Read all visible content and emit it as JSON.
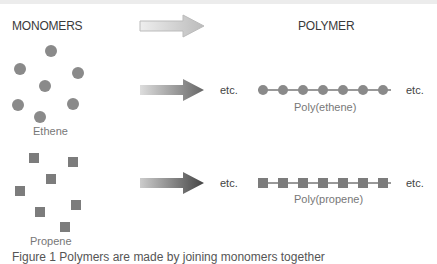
{
  "headers": {
    "monomers": "MONOMERS",
    "polymer": "POLYMER"
  },
  "rows": [
    {
      "monomer": "Ethene",
      "polymer": "Poly(ethene)",
      "unit_shape": "circle",
      "arrow_color": "#777777"
    },
    {
      "monomer": "Propene",
      "polymer": "Poly(propene)",
      "unit_shape": "square",
      "arrow_color": "#555555"
    }
  ],
  "etc_label": "etc.",
  "chain_units": 7,
  "caption_partial": "Figure 1 Polymers are made by joining monomers together"
}
